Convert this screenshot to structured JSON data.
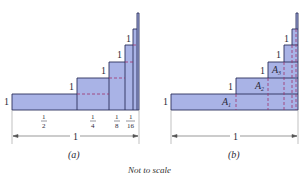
{
  "colors": {
    "fill": "#a9b3e6",
    "stroke": "#2b2f5c",
    "dashed": "#a0306a",
    "text": "#2a2a3a"
  },
  "figure_a": {
    "caption": "(a)",
    "height_labels": [
      "1",
      "1",
      "1",
      "1",
      "1"
    ],
    "width_labels": {
      "half_num": "1",
      "half_den": "2",
      "quarter_num": "1",
      "quarter_den": "4",
      "eighth_num": "1",
      "eighth_den": "8",
      "sixteenth_num": "1",
      "sixteenth_den": "16"
    },
    "total_width_label": "1"
  },
  "figure_b": {
    "caption": "(b)",
    "height_labels": [
      "1",
      "1",
      "1",
      "1",
      "1"
    ],
    "area_labels": {
      "a1": "A",
      "a1_sub": "1",
      "a2": "A",
      "a2_sub": "2",
      "a3": "A",
      "a3_sub": "3"
    },
    "total_width_label": "1"
  },
  "note": "Not to scale"
}
